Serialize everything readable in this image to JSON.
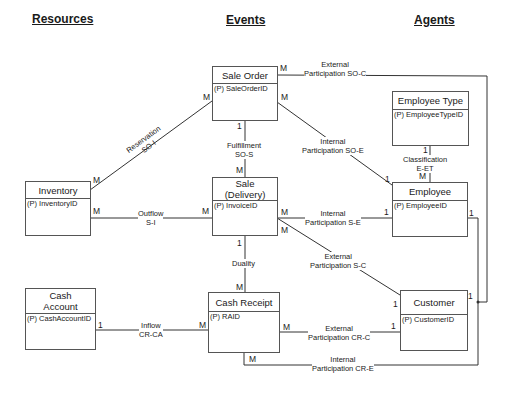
{
  "columns": {
    "resources": "Resources",
    "events": "Events",
    "agents": "Agents"
  },
  "entities": {
    "sale_order": {
      "title": "Sale Order",
      "key": "(P) SaleOrderID"
    },
    "sale_delivery": {
      "title": "Sale (Delivery)",
      "title_line1": "Sale",
      "title_line2": "(Delivery)",
      "key": "(P) InvoiceID"
    },
    "cash_receipt": {
      "title": "Cash Receipt",
      "key": "(P) RAID"
    },
    "inventory": {
      "title": "Inventory",
      "key": "(P) InventoryID"
    },
    "cash_account": {
      "title": "Cash Account",
      "title_line1": "Cash",
      "title_line2": "Account",
      "key": "(P) CashAccountID"
    },
    "employee_type": {
      "title": "Employee Type",
      "key": "(P) EmployeeTypeID"
    },
    "employee": {
      "title": "Employee",
      "key": "(P) EmployeeID"
    },
    "customer": {
      "title": "Customer",
      "key": "(P) CustomerID"
    }
  },
  "relationships": [
    {
      "id": "ext_so_c",
      "line1": "External",
      "line2": "Participation SO-C",
      "from": "Sale Order",
      "to": "Customer",
      "from_card": "M",
      "to_card": "1"
    },
    {
      "id": "reservation",
      "line1": "Reservation",
      "line2": "SO-I",
      "from": "Sale Order",
      "to": "Inventory",
      "from_card": "M",
      "to_card": "M"
    },
    {
      "id": "int_so_e",
      "line1": "Internal",
      "line2": "Participation SO-E",
      "from": "Sale Order",
      "to": "Employee",
      "from_card": "M",
      "to_card": "1"
    },
    {
      "id": "fulfillment",
      "line1": "Fulfillment",
      "line2": "SO-S",
      "from": "Sale Order",
      "to": "Sale (Delivery)",
      "from_card": "1",
      "to_card": "M"
    },
    {
      "id": "classification",
      "line1": "Classification",
      "line2": "E-ET",
      "from": "Employee Type",
      "to": "Employee",
      "from_card": "1",
      "to_card": "M"
    },
    {
      "id": "outflow",
      "line1": "Outflow",
      "line2": "S-I",
      "from": "Inventory",
      "to": "Sale (Delivery)",
      "from_card": "M",
      "to_card": "M"
    },
    {
      "id": "int_s_e",
      "line1": "Internal",
      "line2": "Participation S-E",
      "from": "Sale (Delivery)",
      "to": "Employee",
      "from_card": "M",
      "to_card": "1"
    },
    {
      "id": "ext_s_c",
      "line1": "External",
      "line2": "Participation S-C",
      "from": "Sale (Delivery)",
      "to": "Customer",
      "from_card": "M",
      "to_card": "1"
    },
    {
      "id": "duality",
      "line1": "Duality",
      "line2": "",
      "from": "Sale (Delivery)",
      "to": "Cash Receipt",
      "from_card": "1",
      "to_card": "M"
    },
    {
      "id": "inflow",
      "line1": "Inflow",
      "line2": "CR-CA",
      "from": "Cash Account",
      "to": "Cash Receipt",
      "from_card": "1",
      "to_card": "M"
    },
    {
      "id": "ext_cr_c",
      "line1": "External",
      "line2": "Participation CR-C",
      "from": "Cash Receipt",
      "to": "Customer",
      "from_card": "M",
      "to_card": "1"
    },
    {
      "id": "int_cr_e",
      "line1": "Internal",
      "line2": "Participation CR-E",
      "from": "Cash Receipt",
      "to": "Employee",
      "from_card": "M",
      "to_card": "1"
    }
  ]
}
